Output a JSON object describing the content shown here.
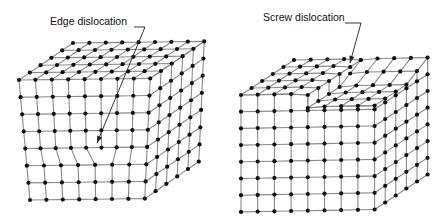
{
  "figure": {
    "background": "#ffffff",
    "atom_color": "#111111",
    "bond_color": "#8a8a8a",
    "panels": [
      {
        "id": "edge",
        "label": "Edge dislocation",
        "label_pos": [
          50,
          21
        ],
        "description": "Simple cubic lattice block with an extra half-plane of atoms inserted from the top, terminating inside the crystal",
        "leader": [
          [
            134,
            27
          ],
          [
            145,
            27
          ],
          [
            97,
            143
          ]
        ],
        "front_top_left": [
          19,
          80
        ],
        "front_cols_top": 9,
        "front_cols_bottom": 8,
        "front_rows": 8,
        "dx_top": 16.4,
        "dx_bottom": 16.4,
        "dy": 17.2,
        "bottom_left": [
          30,
          200
        ],
        "depth_steps": 5,
        "depth_vec": [
          10.8,
          -7.4
        ]
      },
      {
        "id": "screw",
        "label": "Screw dislocation",
        "label_pos": [
          263,
          17
        ],
        "description": "Simple cubic lattice block where part of the crystal is sheared by one atomic spacing, producing a step on the top surface",
        "leader": [
          [
            345,
            23
          ],
          [
            361,
            23
          ],
          [
            350,
            63
          ]
        ],
        "front_top_left": [
          241,
          95
        ],
        "front_cols": 9,
        "front_rows": 7,
        "dx": 16.7,
        "dy": 16.7,
        "step_col": 4,
        "step_height": 13,
        "depth_steps": 5,
        "depth_vec": [
          10.6,
          -7.0
        ]
      }
    ]
  }
}
